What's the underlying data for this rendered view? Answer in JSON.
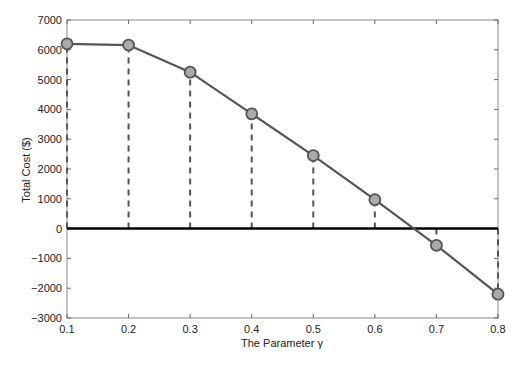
{
  "chart_data": {
    "type": "line",
    "title": "",
    "xlabel": "The Parameter γ",
    "ylabel": "Total Cost ($)",
    "x": [
      0.1,
      0.2,
      0.3,
      0.4,
      0.5,
      0.6,
      0.7,
      0.8
    ],
    "series": [
      {
        "name": "Total Cost",
        "values": [
          6200,
          6160,
          5250,
          3850,
          2450,
          970,
          -560,
          -2200
        ],
        "color": "#555555",
        "marker": "circle",
        "marker_fill": "#aaaaaa",
        "stems": "dashed vertical lines from 0 to each point"
      }
    ],
    "reference_line": {
      "y": 0,
      "color": "#000000"
    },
    "xlim": [
      0.1,
      0.8
    ],
    "ylim": [
      -3000,
      7000
    ],
    "xticks": [
      "0.1",
      "0.2",
      "0.3",
      "0.4",
      "0.5",
      "0.6",
      "0.7",
      "0.8"
    ],
    "yticks": [
      "-3000",
      "-2000",
      "-1000",
      "0",
      "1000",
      "2000",
      "3000",
      "4000",
      "5000",
      "6000",
      "7000"
    ],
    "grid": false,
    "legend": null
  }
}
